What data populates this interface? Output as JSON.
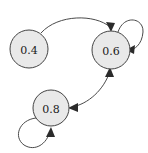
{
  "diagram": {
    "type": "directed-graph",
    "title": "",
    "background_color": "#ffffff",
    "node_fill_color": "#e9e9e9",
    "node_stroke_color": "#444444",
    "edge_color": "#4a4a4a",
    "arrow_color": "#2b2b2b",
    "nodes": [
      {
        "id": "n04",
        "label": "0.4",
        "cx": 29,
        "cy": 49,
        "r": 19
      },
      {
        "id": "n06",
        "label": "0.6",
        "cx": 111,
        "cy": 50,
        "r": 19
      },
      {
        "id": "n08",
        "label": "0.8",
        "cx": 51,
        "cy": 108,
        "r": 18
      }
    ],
    "edges": [
      {
        "id": "e-04-06",
        "from": "0.4",
        "to": "0.6",
        "kind": "curve",
        "arrow_at": "end"
      },
      {
        "id": "e-06-self",
        "from": "0.6",
        "to": "0.6",
        "kind": "self-loop",
        "arrow_at": "end"
      },
      {
        "id": "e-08-self",
        "from": "0.8",
        "to": "0.8",
        "kind": "self-loop",
        "arrow_at": "end"
      },
      {
        "id": "e-06-08",
        "from": "0.6",
        "to": "0.8",
        "kind": "curve",
        "arrow_at": "both"
      }
    ]
  }
}
